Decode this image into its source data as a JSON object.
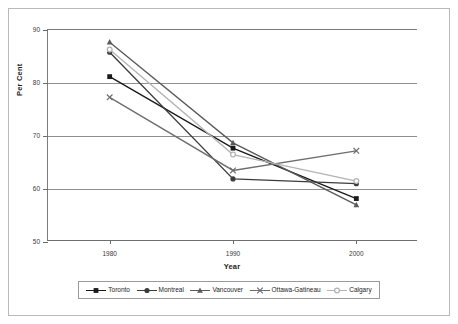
{
  "chart_data": {
    "type": "line",
    "title": "",
    "xlabel": "Year",
    "ylabel": "Per Cent",
    "categories": [
      "1980",
      "1990",
      "2000"
    ],
    "x": [
      1980,
      1990,
      2000
    ],
    "xlim": [
      1975,
      2005
    ],
    "ylim": [
      50,
      90
    ],
    "yticks": [
      50,
      60,
      70,
      80,
      90
    ],
    "ytick_labels": [
      "50",
      "60",
      "70",
      "80",
      "90"
    ],
    "xtick_labels": [
      "1980",
      "1990",
      "2000"
    ],
    "grid": true,
    "legend_position": "bottom",
    "series": [
      {
        "name": "Toronto",
        "values": [
          81.2,
          67.7,
          58.2
        ],
        "color": "#1a1a1a",
        "marker": "square"
      },
      {
        "name": "Montreal",
        "values": [
          85.8,
          61.9,
          61.0
        ],
        "color": "#3c3c3c",
        "marker": "circle"
      },
      {
        "name": "Vancouver",
        "values": [
          87.7,
          68.7,
          57.0
        ],
        "color": "#5a5a5a",
        "marker": "triangle"
      },
      {
        "name": "Ottawa-Gatineau",
        "values": [
          77.3,
          63.5,
          67.2
        ],
        "color": "#6e6e6e",
        "marker": "x"
      },
      {
        "name": "Calgary",
        "values": [
          86.3,
          66.5,
          61.5
        ],
        "color": "#b4b4b4",
        "marker": "circle-open"
      }
    ]
  },
  "legend": {
    "items": [
      {
        "label": "Toronto"
      },
      {
        "label": "Montreal"
      },
      {
        "label": "Vancouver"
      },
      {
        "label": "Ottawa-Gatineau"
      },
      {
        "label": "Calgary"
      }
    ]
  },
  "axes": {
    "y_title": "Per Cent",
    "x_title": "Year"
  },
  "colors": {
    "frame": "#b9b9b9",
    "gridline": "#8f8f8f",
    "axis": "#6e6e6e",
    "background": "#ffffff",
    "text": "#1d1d1d"
  }
}
